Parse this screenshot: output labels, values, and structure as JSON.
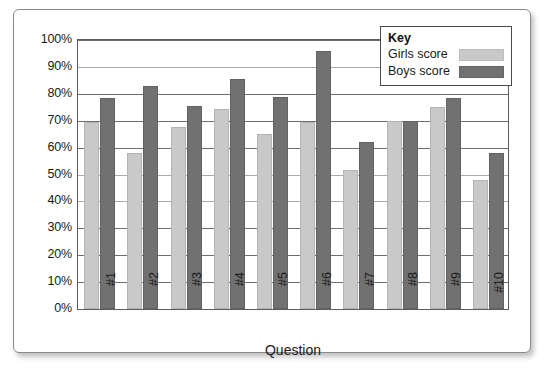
{
  "chart_data": {
    "type": "bar",
    "title": "",
    "xlabel": "Question",
    "ylabel": "",
    "categories": [
      "#1",
      "#2",
      "#3",
      "#4",
      "#5",
      "#6",
      "#7",
      "#8",
      "#9",
      "#10"
    ],
    "series": [
      {
        "name": "Girls score",
        "color": "#c9c9c9",
        "values": [
          69.5,
          58,
          67.5,
          74.5,
          65,
          69.5,
          51.5,
          70,
          75,
          48
        ]
      },
      {
        "name": "Boys score",
        "color": "#717171",
        "values": [
          78.5,
          83,
          75.5,
          85.5,
          79,
          96,
          62,
          70,
          78.5,
          58
        ]
      }
    ],
    "ylim": [
      0,
      100
    ],
    "ytick_step": 10,
    "ytick_labels": [
      "100%",
      "90%",
      "80%",
      "70%",
      "60%",
      "50%",
      "40%",
      "30%",
      "20%",
      "10%",
      "0%"
    ],
    "grid": true,
    "legend_position": "top-right"
  },
  "legend": {
    "title": "Key",
    "entries": [
      {
        "label": "Girls score",
        "swatch": "girls"
      },
      {
        "label": "Boys score",
        "swatch": "boys"
      }
    ]
  },
  "axis": {
    "x_title": "Question"
  },
  "colors": {
    "girls": "#c9c9c9",
    "boys": "#717171",
    "gridline": "#6e6e6e",
    "frame": "#5c5c5c",
    "card_border": "#8a8a8a"
  }
}
